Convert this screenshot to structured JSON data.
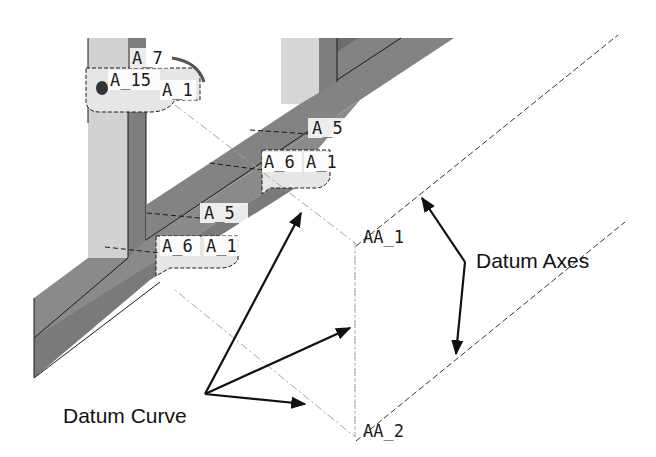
{
  "figure": {
    "type": "CAD model illustration with datum features",
    "callouts": {
      "datum_axes": "Datum Axes",
      "datum_curve": "Datum Curve"
    },
    "axis_labels": {
      "aa1": "AA_1",
      "aa2": "AA_2"
    },
    "feature_labels": {
      "top_a7": "A_7",
      "top_a15": "A_15",
      "top_a1": "A_1",
      "mid_a5": "A_5",
      "mid_a6": "A_6",
      "mid_a1": "A_1",
      "low_a5": "A_5",
      "low_a6": "A_6",
      "low_a1": "A_1"
    },
    "colors": {
      "background": "#ffffff",
      "dark_face": "#7a7a7a",
      "mid_face": "#8c8c8c",
      "light_face": "#d2d2d2",
      "bracket": "#e4e4e4",
      "edge": "#1a1a1a",
      "datum_line": "#9a9a9a"
    }
  }
}
